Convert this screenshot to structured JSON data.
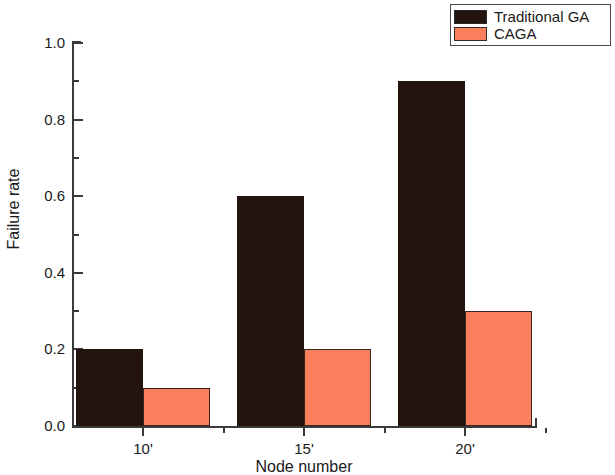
{
  "chart_data": {
    "type": "bar",
    "title": "",
    "xlabel": "Node number",
    "ylabel": "Failure rate",
    "categories": [
      "10'",
      "15'",
      "20'"
    ],
    "series": [
      {
        "name": "Traditional GA",
        "color": "#241410",
        "values": [
          0.2,
          0.6,
          0.9
        ]
      },
      {
        "name": "CAGA",
        "color": "#fa7f5c",
        "values": [
          0.1,
          0.2,
          0.3
        ]
      }
    ],
    "ylim": [
      0.0,
      1.0
    ],
    "ytick_labels": [
      "0.0",
      "0.2",
      "0.4",
      "0.6",
      "0.8",
      "1.0"
    ],
    "ytick_values": [
      0.0,
      0.2,
      0.4,
      0.6,
      0.8,
      1.0
    ],
    "yminor_values": [
      0.1,
      0.3,
      0.5,
      0.7,
      0.9
    ],
    "grid": false,
    "legend_position": "top-right"
  },
  "legend": {
    "entries": [
      {
        "label": "Traditional GA",
        "color": "#241410"
      },
      {
        "label": "CAGA",
        "color": "#fa7f5c"
      }
    ]
  }
}
